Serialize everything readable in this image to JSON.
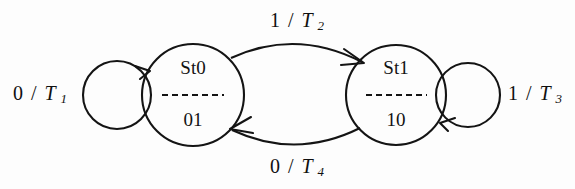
{
  "diagram": {
    "type": "state-transition-diagram",
    "title": "",
    "background_color": "#fdfdfd",
    "stroke_color": "#141414",
    "states": [
      {
        "id": "st0",
        "name": "St0",
        "output": "01",
        "center_x": 193,
        "center_y": 95,
        "radius": 51
      },
      {
        "id": "st1",
        "name": "St1",
        "output": "10",
        "center_x": 396,
        "center_y": 95,
        "radius": 50
      }
    ],
    "transitions": [
      {
        "id": "t1",
        "from": "st0",
        "to": "st0",
        "kind": "self-loop",
        "side": "left",
        "input": "0",
        "separator": "/",
        "action": "T",
        "action_subscript": "1",
        "label": "0 / T1",
        "label_x": 40,
        "label_y": 95
      },
      {
        "id": "t2",
        "from": "st0",
        "to": "st1",
        "kind": "arc",
        "side": "top",
        "input": "1",
        "separator": "/",
        "action": "T",
        "action_subscript": "2",
        "label": "1 / T2",
        "label_x": 297,
        "label_y": 22
      },
      {
        "id": "t3",
        "from": "st1",
        "to": "st1",
        "kind": "self-loop",
        "side": "right",
        "input": "1",
        "separator": "/",
        "action": "T",
        "action_subscript": "3",
        "label": "1 / T3",
        "label_x": 535,
        "label_y": 95
      },
      {
        "id": "t4",
        "from": "st1",
        "to": "st0",
        "kind": "arc",
        "side": "bottom",
        "input": "0",
        "separator": "/",
        "action": "T",
        "action_subscript": "4",
        "label": "0 / T4",
        "label_x": 297,
        "label_y": 168
      }
    ]
  }
}
